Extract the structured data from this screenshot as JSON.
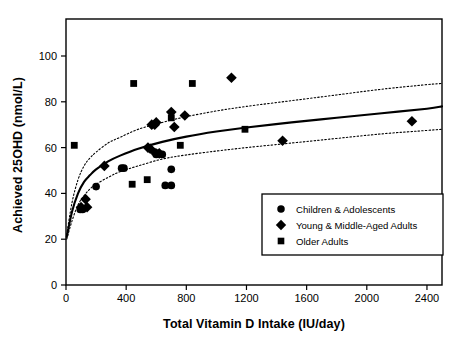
{
  "chart_data": {
    "type": "scatter",
    "title": "",
    "xlabel": "Total Vitamin D Intake (IU/day)",
    "ylabel": "Achieved 25OHD (nmol/L)",
    "xlim": [
      0,
      2500
    ],
    "ylim": [
      0,
      112
    ],
    "xticks": [
      0,
      400,
      800,
      1200,
      1600,
      2000,
      2400
    ],
    "xticklabels": [
      "0",
      "400",
      "800",
      "1200",
      "1600",
      "2000",
      "2400"
    ],
    "yticks": [
      0,
      20,
      40,
      60,
      80,
      100
    ],
    "yticklabels": [
      "0",
      "20",
      "40",
      "60",
      "80",
      "100"
    ],
    "grid": false,
    "legend_position": "lower right",
    "series": [
      {
        "name": "Children & Adolescents",
        "marker": "circle",
        "color": "#000000",
        "points": [
          [
            95,
            33
          ],
          [
            110,
            33
          ],
          [
            200,
            43
          ],
          [
            370,
            51
          ],
          [
            385,
            51
          ],
          [
            590,
            58
          ],
          [
            600,
            57
          ],
          [
            640,
            57
          ],
          [
            700,
            50.5
          ],
          [
            700,
            43.5
          ],
          [
            660,
            43.5
          ]
        ]
      },
      {
        "name": "Young & Middle-Aged Adults",
        "marker": "diamond",
        "color": "#000000",
        "points": [
          [
            100,
            34
          ],
          [
            130,
            37.5
          ],
          [
            140,
            34
          ],
          [
            255,
            52
          ],
          [
            545,
            60
          ],
          [
            560,
            59.5
          ],
          [
            570,
            70
          ],
          [
            590,
            70
          ],
          [
            600,
            71
          ],
          [
            620,
            57.5
          ],
          [
            700,
            75.5
          ],
          [
            720,
            69
          ],
          [
            790,
            74
          ],
          [
            1100,
            90.5
          ],
          [
            1440,
            63
          ],
          [
            2300,
            71.5
          ]
        ]
      },
      {
        "name": "Older Adults",
        "marker": "square",
        "color": "#000000",
        "points": [
          [
            55,
            61
          ],
          [
            110,
            33.5
          ],
          [
            440,
            44
          ],
          [
            450,
            88
          ],
          [
            540,
            46
          ],
          [
            700,
            73
          ],
          [
            760,
            61
          ],
          [
            840,
            88
          ],
          [
            1190,
            68
          ]
        ]
      }
    ],
    "fit_curve": {
      "name": "regression",
      "style": "solid",
      "points": [
        [
          5,
          21
        ],
        [
          40,
          32
        ],
        [
          80,
          40
        ],
        [
          120,
          45
        ],
        [
          160,
          48
        ],
        [
          200,
          50.5
        ],
        [
          280,
          54
        ],
        [
          360,
          56.5
        ],
        [
          480,
          59.5
        ],
        [
          640,
          62.5
        ],
        [
          800,
          64.8
        ],
        [
          1000,
          67
        ],
        [
          1200,
          68.8
        ],
        [
          1500,
          71
        ],
        [
          1800,
          73
        ],
        [
          2100,
          75
        ],
        [
          2400,
          77
        ],
        [
          2500,
          78
        ]
      ]
    },
    "confidence_bands": [
      {
        "name": "upper-confidence-band",
        "style": "dotted",
        "points": [
          [
            5,
            22
          ],
          [
            40,
            36
          ],
          [
            80,
            46
          ],
          [
            120,
            52
          ],
          [
            160,
            55.5
          ],
          [
            200,
            58
          ],
          [
            280,
            62
          ],
          [
            360,
            64.5
          ],
          [
            480,
            68
          ],
          [
            640,
            71
          ],
          [
            800,
            73.5
          ],
          [
            1000,
            76
          ],
          [
            1200,
            78
          ],
          [
            1500,
            80.5
          ],
          [
            1800,
            83
          ],
          [
            2100,
            85.5
          ],
          [
            2400,
            87.5
          ],
          [
            2500,
            88
          ]
        ]
      },
      {
        "name": "lower-confidence-band",
        "style": "dotted",
        "points": [
          [
            5,
            20
          ],
          [
            40,
            28
          ],
          [
            80,
            35
          ],
          [
            120,
            39
          ],
          [
            160,
            42
          ],
          [
            200,
            44
          ],
          [
            280,
            47
          ],
          [
            360,
            49.5
          ],
          [
            480,
            52
          ],
          [
            640,
            55
          ],
          [
            800,
            56.8
          ],
          [
            1000,
            58.5
          ],
          [
            1200,
            60
          ],
          [
            1500,
            62
          ],
          [
            1800,
            64
          ],
          [
            2100,
            66
          ],
          [
            2400,
            67.5
          ],
          [
            2500,
            68
          ]
        ]
      }
    ],
    "legend": [
      {
        "marker": "circle",
        "label": "Children & Adolescents"
      },
      {
        "marker": "diamond",
        "label": "Young & Middle-Aged Adults"
      },
      {
        "marker": "square",
        "label": "Older Adults"
      }
    ]
  }
}
